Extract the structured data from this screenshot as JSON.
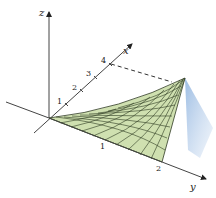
{
  "figure": {
    "type": "3d-surface-plot",
    "axes": {
      "x": {
        "label": "x",
        "ticks": [
          "1",
          "2",
          "3",
          "4"
        ]
      },
      "y": {
        "label": "y",
        "ticks": [
          "1",
          "2"
        ]
      },
      "z": {
        "label": "z",
        "ticks": []
      }
    },
    "surface": {
      "fill_color": "#cfe0b0",
      "grid_color": "#2e3a22",
      "side_color": "#a9c6e6"
    },
    "guide_line": "dashed line from x=4 to surface corner"
  }
}
